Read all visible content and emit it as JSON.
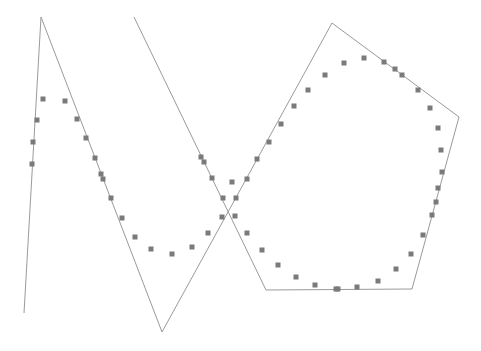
{
  "chart_data": {
    "type": "scatter",
    "title": "",
    "xlabel": "",
    "ylabel": "",
    "grid": false,
    "legend": "none",
    "colors": {
      "line": "#9a9a9a",
      "marker": "#7a7a7a",
      "background": "#ffffff"
    },
    "series": [
      {
        "name": "polyline",
        "kind": "line",
        "points": [
          [
            24,
            313
          ],
          [
            41,
            17
          ],
          [
            162,
            332
          ],
          [
            332,
            23
          ],
          [
            459,
            117
          ],
          [
            412,
            289
          ],
          [
            266,
            290
          ],
          [
            134,
            17
          ]
        ]
      },
      {
        "name": "markers",
        "kind": "scatter",
        "points": [
          [
            43,
            99
          ],
          [
            65,
            101
          ],
          [
            37,
            120
          ],
          [
            77,
            119
          ],
          [
            33,
            142
          ],
          [
            86,
            138
          ],
          [
            32,
            164
          ],
          [
            95,
            158
          ],
          [
            101,
            174
          ],
          [
            103,
            179
          ],
          [
            111,
            198
          ],
          [
            122,
            218
          ],
          [
            135,
            237
          ],
          [
            151,
            249
          ],
          [
            172,
            254
          ],
          [
            192,
            247
          ],
          [
            208,
            233
          ],
          [
            222,
            217
          ],
          [
            235,
            216
          ],
          [
            223,
            198
          ],
          [
            236,
            198
          ],
          [
            212,
            178
          ],
          [
            232,
            182
          ],
          [
            201,
            157
          ],
          [
            204,
            162
          ],
          [
            247,
            179
          ],
          [
            257,
            159
          ],
          [
            269,
            142
          ],
          [
            281,
            124
          ],
          [
            294,
            106
          ],
          [
            308,
            90
          ],
          [
            325,
            75
          ],
          [
            344,
            63
          ],
          [
            364,
            58
          ],
          [
            384,
            62
          ],
          [
            395,
            69
          ],
          [
            402,
            75
          ],
          [
            418,
            90
          ],
          [
            430,
            108
          ],
          [
            438,
            128
          ],
          [
            441,
            150
          ],
          [
            442,
            172
          ],
          [
            438,
            188
          ],
          [
            436,
            202
          ],
          [
            432,
            215
          ],
          [
            423,
            235
          ],
          [
            411,
            254
          ],
          [
            396,
            269
          ],
          [
            378,
            281
          ],
          [
            357,
            287
          ],
          [
            338,
            289
          ],
          [
            336,
            289
          ],
          [
            315,
            285
          ],
          [
            296,
            277
          ],
          [
            278,
            265
          ],
          [
            262,
            250
          ],
          [
            247,
            233
          ]
        ]
      }
    ]
  }
}
